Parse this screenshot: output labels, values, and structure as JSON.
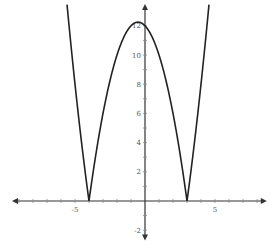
{
  "chart_data": {
    "type": "line",
    "title": "",
    "xlabel": "",
    "ylabel": "",
    "function": "y = |x^2 + x - 12| = |(x+4)(x-3)|",
    "series": [
      {
        "name": "f(x)",
        "x_domain": [
          -5.57,
          4.57
        ],
        "points": [
          [
            -5.57,
            13.45
          ],
          [
            -5.0,
            8.0
          ],
          [
            -4.5,
            3.75
          ],
          [
            -4.0,
            0.0
          ],
          [
            -3.5,
            3.25
          ],
          [
            -3.0,
            6.0
          ],
          [
            -2.0,
            10.0
          ],
          [
            -1.0,
            12.0
          ],
          [
            -0.5,
            12.25
          ],
          [
            0.0,
            12.0
          ],
          [
            1.0,
            10.0
          ],
          [
            2.0,
            6.0
          ],
          [
            2.5,
            3.25
          ],
          [
            3.0,
            0.0
          ],
          [
            3.5,
            3.75
          ],
          [
            4.0,
            8.0
          ],
          [
            4.57,
            13.45
          ]
        ],
        "zeros": [
          -4,
          3
        ],
        "vertex": [
          -0.5,
          12.25
        ],
        "color": "#222222"
      }
    ],
    "xlim": [
      -9.5,
      8.7
    ],
    "ylim": [
      -2.7,
      13.5
    ],
    "x_ticks": [
      -9,
      -8,
      -7,
      -6,
      -5,
      -4,
      -3,
      -2,
      -1,
      1,
      2,
      3,
      4,
      5,
      6,
      7,
      8
    ],
    "x_tick_labels": [
      {
        "value": -5,
        "label": "-5"
      },
      {
        "value": 5,
        "label": "5"
      }
    ],
    "y_ticks": [
      -2,
      -1,
      1,
      2,
      3,
      4,
      5,
      6,
      7,
      8,
      9,
      10,
      11,
      12
    ],
    "y_tick_labels": [
      {
        "value": 12,
        "label": "12"
      },
      {
        "value": 10,
        "label": "10"
      },
      {
        "value": 8,
        "label": "8"
      },
      {
        "value": 6,
        "label": "6"
      },
      {
        "value": 4,
        "label": "4"
      },
      {
        "value": 2,
        "label": "2"
      },
      {
        "value": -2,
        "label": "-2"
      }
    ],
    "grid": false,
    "legend": "none",
    "axes_arrows": true,
    "axis_color": "#333333"
  }
}
